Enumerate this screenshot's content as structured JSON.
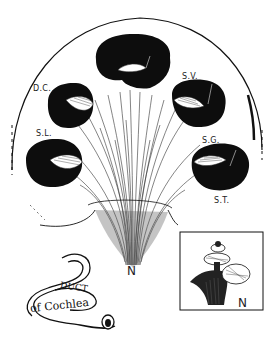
{
  "figure": {
    "labels": {
      "dc": "D.C.",
      "sv": "S.V.",
      "sl": "S.L.",
      "sg": "S.G.",
      "st": "S.T.",
      "n_main": "N",
      "n_inset": "N"
    },
    "scroll": {
      "line1": "DUCT",
      "line2": "of Cochlea"
    },
    "colors": {
      "ink": "#111111",
      "paper": "#ffffff"
    }
  }
}
